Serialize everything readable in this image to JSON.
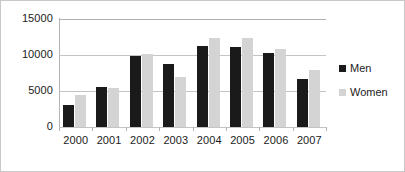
{
  "chart_data": {
    "type": "bar",
    "title": "",
    "subtitle": "",
    "xlabel": "",
    "ylabel": "",
    "categories": [
      "2000",
      "2001",
      "2002",
      "2003",
      "2004",
      "2005",
      "2006",
      "2007"
    ],
    "series": [
      {
        "name": "Men",
        "color": "#1a1a1a",
        "values": [
          3000,
          5500,
          9900,
          8800,
          11200,
          11150,
          10300,
          6600
        ]
      },
      {
        "name": "Women",
        "color": "#d4d4d4",
        "values": [
          4450,
          5350,
          10200,
          6900,
          12400,
          12400,
          10900,
          7900
        ]
      }
    ],
    "ylim": [
      0,
      15000
    ],
    "yticks": [
      0,
      5000,
      10000,
      15000
    ],
    "ytick_labels": [
      "0",
      "5000",
      "10000",
      "15000"
    ],
    "grid": true,
    "legend_position": "right"
  },
  "legend": {
    "entries": [
      {
        "label": "Men"
      },
      {
        "label": "Women"
      }
    ]
  }
}
